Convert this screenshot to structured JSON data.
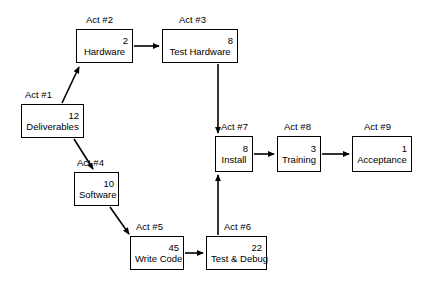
{
  "diagram": {
    "type": "activity-on-node network diagram",
    "nodes": [
      {
        "id": "act1",
        "act": "Act #1",
        "name": "Deliverables",
        "duration": "12",
        "box": {
          "x": 21,
          "y": 104,
          "w": 63,
          "h": 34
        },
        "act_pos": {
          "x": 25,
          "y": 89
        }
      },
      {
        "id": "act2",
        "act": "Act #2",
        "name": "Hardware",
        "duration": "2",
        "box": {
          "x": 76,
          "y": 29,
          "w": 57,
          "h": 34
        },
        "act_pos": {
          "x": 86,
          "y": 14
        }
      },
      {
        "id": "act3",
        "act": "Act #3",
        "name": "Test Hardware",
        "duration": "8",
        "box": {
          "x": 162,
          "y": 29,
          "w": 76,
          "h": 34
        },
        "act_pos": {
          "x": 179,
          "y": 14
        }
      },
      {
        "id": "act4",
        "act": "Act #4",
        "name": "Software",
        "duration": "10",
        "box": {
          "x": 74,
          "y": 172,
          "w": 45,
          "h": 34
        },
        "act_pos": {
          "x": 77,
          "y": 157
        }
      },
      {
        "id": "act5",
        "act": "Act #5",
        "name": "Write Code",
        "duration": "45",
        "box": {
          "x": 130,
          "y": 236,
          "w": 54,
          "h": 34
        },
        "act_pos": {
          "x": 136,
          "y": 221
        }
      },
      {
        "id": "act6",
        "act": "Act #6",
        "name": "Test & Debug",
        "duration": "22",
        "box": {
          "x": 206,
          "y": 236,
          "w": 61,
          "h": 34
        },
        "act_pos": {
          "x": 224,
          "y": 221
        }
      },
      {
        "id": "act7",
        "act": "Act #7",
        "name": "Install",
        "duration": "8",
        "box": {
          "x": 215,
          "y": 136,
          "w": 38,
          "h": 36
        },
        "act_pos": {
          "x": 221,
          "y": 121
        }
      },
      {
        "id": "act8",
        "act": "Act #8",
        "name": "Training",
        "duration": "3",
        "box": {
          "x": 277,
          "y": 136,
          "w": 44,
          "h": 36
        },
        "act_pos": {
          "x": 284,
          "y": 121
        }
      },
      {
        "id": "act9",
        "act": "Act #9",
        "name": "Acceptance",
        "duration": "1",
        "box": {
          "x": 352,
          "y": 136,
          "w": 60,
          "h": 36
        },
        "act_pos": {
          "x": 364,
          "y": 121
        }
      }
    ],
    "edges": [
      {
        "from": "act1",
        "to": "act2",
        "style": "diagonal-up"
      },
      {
        "from": "act2",
        "to": "act3",
        "style": "horizontal"
      },
      {
        "from": "act3",
        "to": "act7",
        "style": "vertical-down"
      },
      {
        "from": "act1",
        "to": "act4",
        "style": "diagonal-down"
      },
      {
        "from": "act4",
        "to": "act5",
        "style": "diagonal-down"
      },
      {
        "from": "act5",
        "to": "act6",
        "style": "horizontal"
      },
      {
        "from": "act6",
        "to": "act7",
        "style": "vertical-up"
      },
      {
        "from": "act7",
        "to": "act8",
        "style": "horizontal"
      },
      {
        "from": "act8",
        "to": "act9",
        "style": "horizontal"
      }
    ],
    "colors": {
      "line": "#000000",
      "box_fill": "#ffffff",
      "text": "#000000",
      "background": "#ffffff"
    }
  }
}
